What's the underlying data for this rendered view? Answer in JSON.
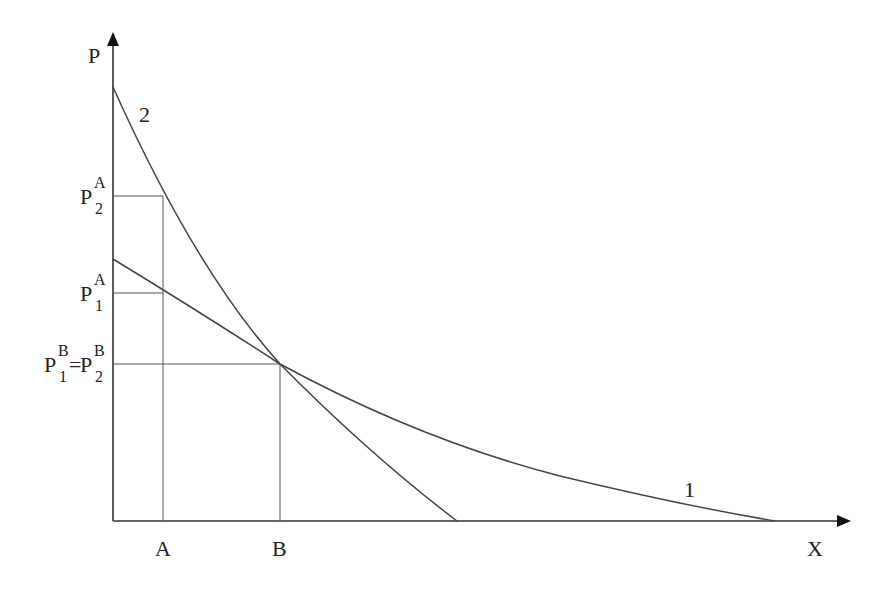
{
  "diagram": {
    "type": "economics-demand-curves",
    "axes": {
      "y_label": "P",
      "x_label": "X"
    },
    "curves": [
      {
        "id": "1",
        "label": "1",
        "shape": "convex, shallow slope, intercepts P-axis lower and X-axis far right"
      },
      {
        "id": "2",
        "label": "2",
        "shape": "convex, steep slope, intercepts P-axis higher and X-axis nearer"
      }
    ],
    "x_ticks": [
      {
        "label": "A"
      },
      {
        "label": "B"
      }
    ],
    "y_ticks": [
      {
        "id": "p2a",
        "base": "P",
        "sub": "2",
        "sup": "A"
      },
      {
        "id": "p1a",
        "base": "P",
        "sub": "1",
        "sup": "A"
      },
      {
        "id": "pb",
        "base": "P",
        "sub": "1",
        "sup": "B",
        "eq": "=",
        "base2": "P",
        "sub2": "2",
        "sup2": "B"
      }
    ],
    "intersection": {
      "label": "curves 1 and 2 intersect at quantity B, price P1B = P2B"
    }
  },
  "colors": {
    "line": "#444444",
    "axis": "#333333",
    "background": "#ffffff"
  }
}
